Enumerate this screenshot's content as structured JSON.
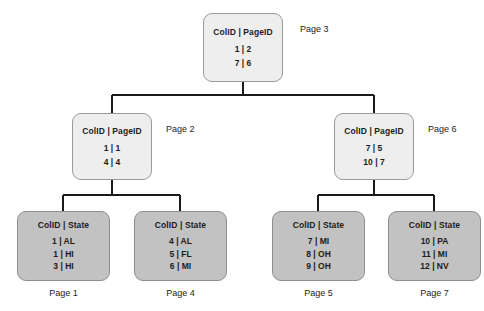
{
  "diagram": {
    "type": "b-tree-index",
    "title": "",
    "colors": {
      "internal_node_fill": "#eeeeee",
      "leaf_node_fill": "#c2c2c2",
      "node_border": "#8e8e8e",
      "connector": "#1a1a1a",
      "background": "#ffffff",
      "text": "#1c1c1c"
    },
    "nodes": {
      "root": {
        "label": "Page 3",
        "header": "ColID | PageID",
        "rows": [
          "1 | 2",
          "7 | 6"
        ],
        "kind": "internal"
      },
      "level2_left": {
        "label": "Page 2",
        "header": "ColID | PageID",
        "rows": [
          "1 | 1",
          "4 | 4"
        ],
        "kind": "internal"
      },
      "level2_right": {
        "label": "Page 6",
        "header": "ColID | PageID",
        "rows": [
          "7 | 5",
          "10 | 7"
        ],
        "kind": "internal"
      },
      "leaf1": {
        "label": "Page 1",
        "header": "ColID | State",
        "rows": [
          "1 | AL",
          "1 | HI",
          "3 | HI"
        ],
        "kind": "leaf"
      },
      "leaf4": {
        "label": "Page 4",
        "header": "ColID | State",
        "rows": [
          "4 | AL",
          "5 | FL",
          "6 | MI"
        ],
        "kind": "leaf"
      },
      "leaf5": {
        "label": "Page 5",
        "header": "ColID | State",
        "rows": [
          "7 | MI",
          "8 | OH",
          "9 | OH"
        ],
        "kind": "leaf"
      },
      "leaf7": {
        "label": "Page 7",
        "header": "ColID | State",
        "rows": [
          "10 | PA",
          "11 | MI",
          "12 | NV"
        ],
        "kind": "leaf"
      }
    }
  }
}
